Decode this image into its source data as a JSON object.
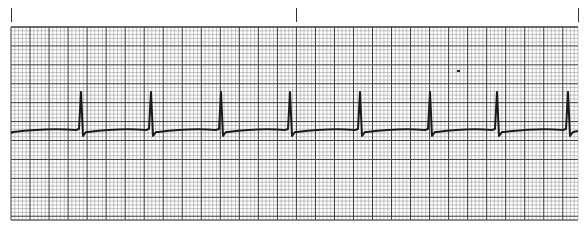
{
  "chart_data": {
    "type": "line",
    "title": "",
    "subtitle": "ECG rhythm strip",
    "xlabel": "",
    "ylabel": "",
    "grid": true,
    "legend": null,
    "grid_spec": {
      "paper_left": 11,
      "paper_top": 27,
      "paper_right": 578,
      "paper_bottom": 220,
      "minor_px": 3.8,
      "major_px": 19,
      "minor_color": "#9a9a9a",
      "major_color": "#3a3a3a"
    },
    "time_marks_x": [
      11,
      296,
      578
    ],
    "baseline_y": 131,
    "r_peak_y": 92,
    "s_wave_y": 136,
    "beats_x": [
      81,
      151,
      221,
      290,
      360,
      430,
      497,
      568
    ],
    "beat_count": 8,
    "trace_color": "#1a1a1a",
    "artifact": {
      "x": 457,
      "y": 70
    }
  }
}
